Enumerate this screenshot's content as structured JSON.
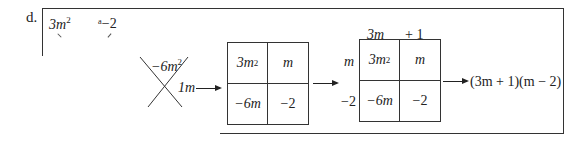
{
  "problem": {
    "label": "d.",
    "top_terms": {
      "left": "3m",
      "left_exp": "2",
      "right": "ᵃ−2"
    },
    "cross_method": {
      "top": "−6m",
      "top_exp": "2",
      "right": "1m"
    },
    "grid1": {
      "cells": [
        {
          "base": "3m",
          "exp": "2"
        },
        {
          "base": "m",
          "exp": ""
        },
        {
          "base": "−6m",
          "exp": ""
        },
        {
          "base": "−2",
          "exp": ""
        }
      ]
    },
    "grid2": {
      "col_headers": [
        "3m",
        "+ 1"
      ],
      "row_headers": [
        "m",
        "−2"
      ],
      "cells": [
        {
          "base": "3m",
          "exp": "2"
        },
        {
          "base": "m",
          "exp": ""
        },
        {
          "base": "−6m",
          "exp": ""
        },
        {
          "base": "−2",
          "exp": ""
        }
      ]
    },
    "result": "(3m + 1)(m − 2)"
  }
}
